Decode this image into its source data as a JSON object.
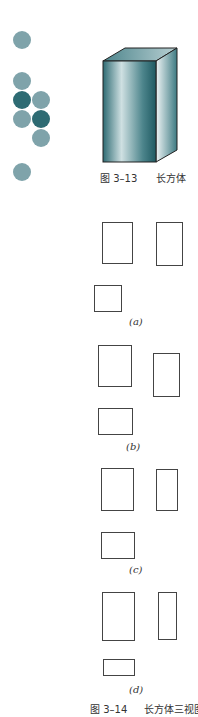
{
  "figure_3_13": {
    "caption_num": "图 3–13",
    "caption_title": "长方体"
  },
  "figure_3_14": {
    "caption_num": "图 3–14",
    "caption_title": "长方体三视图",
    "options": [
      {
        "label": "(a)"
      },
      {
        "label": "(b)"
      },
      {
        "label": "(c)"
      },
      {
        "label": "(d)"
      }
    ]
  },
  "colors": {
    "dot_light": "#7fa3aa",
    "dot_dark": "#2e6b73",
    "box_dark": "#1f5a62",
    "box_light": "#e8f0f1"
  }
}
